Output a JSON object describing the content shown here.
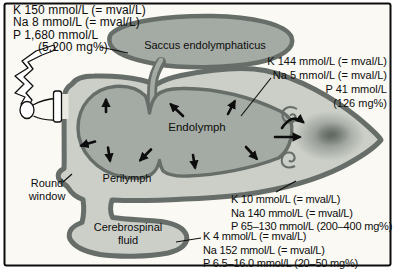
{
  "colors": {
    "frame_bg": "#faf9f3",
    "fluid_light": "#cbcfc8",
    "fluid_mid": "#a4aaa4",
    "outline_dark": "#676d68",
    "stipple_dark": "#4c564f",
    "ink": "#0d0d0d"
  },
  "labels": {
    "saccus": "Saccus endolymphaticus",
    "endolymph": "Endolymph",
    "perilymph": "Perilymph",
    "round_window_line1": "Round",
    "round_window_line2": "window",
    "csf_line1": "Cerebrospinal",
    "csf_line2": "fluid"
  },
  "concentrations": {
    "endolymph_sac": {
      "lines": [
        "K 150 mmol/L (= mval/L)",
        "Na 8 mmol/L (= mval/L)",
        "P 1,680 mmol/L",
        "(5,200 mg%)"
      ]
    },
    "endolymph": {
      "lines": [
        "K 144 mmol/L (= mval/L)",
        "Na 5 mmol/L (= mval/L)",
        "P 41 mmol/L",
        "(126 mg%)"
      ]
    },
    "perilymph": {
      "lines": [
        "K 10 mmol/L (= mval/L)",
        "Na 140 mmol/L (= mval/L)",
        "P 65–130 mmol/L (200–400 mg%)"
      ]
    },
    "cerebrospinal_fluid": {
      "lines": [
        "K 4 mmol/L (= mval/L)",
        "Na 152 mmol/L (= mval/L)",
        "P 6.5–16.0 mmol/L (20–50 mg%)"
      ]
    }
  }
}
